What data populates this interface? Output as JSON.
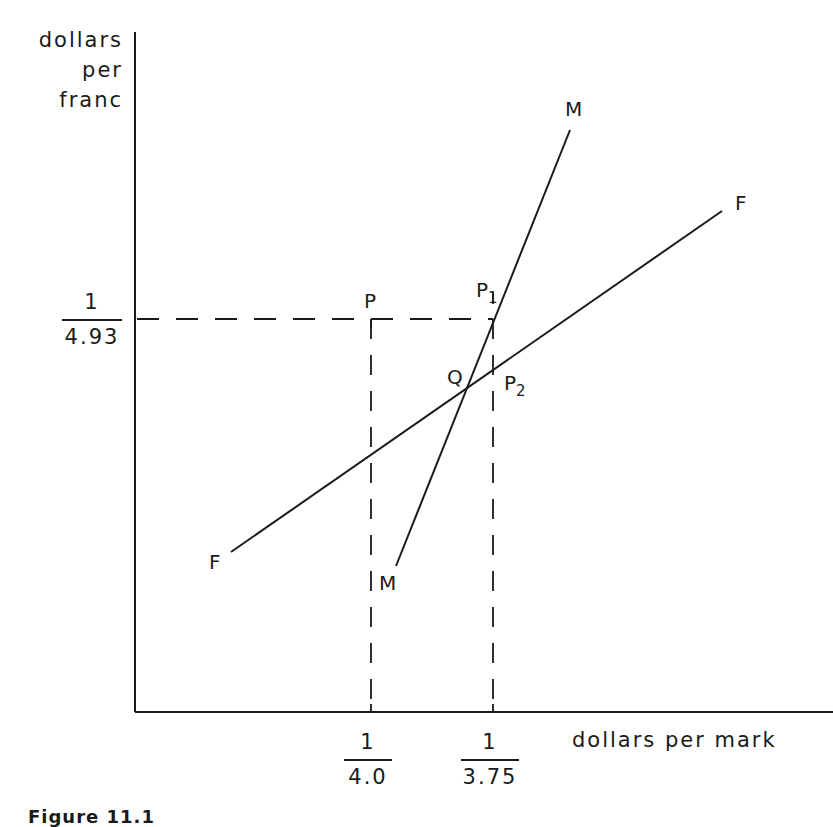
{
  "diagram": {
    "y_axis_label": [
      "dollars",
      "per",
      "franc"
    ],
    "x_axis_label": "dollars per mark",
    "y_tick": {
      "numerator": "1",
      "denominator": "4.93"
    },
    "x_ticks": [
      {
        "numerator": "1",
        "denominator": "4.0"
      },
      {
        "numerator": "1",
        "denominator": "3.75"
      }
    ],
    "curves": {
      "M": {
        "label_top": "M",
        "label_bottom": "M"
      },
      "F": {
        "label_top": "F",
        "label_bottom": "F"
      }
    },
    "points": {
      "P": "P",
      "P1": {
        "base": "P",
        "sub": "1"
      },
      "P2": {
        "base": "P",
        "sub": "2"
      },
      "Q": "Q"
    },
    "caption": "Figure 11.1"
  },
  "colors": {
    "ink": "#1a1a1a",
    "background": "#ffffff"
  }
}
